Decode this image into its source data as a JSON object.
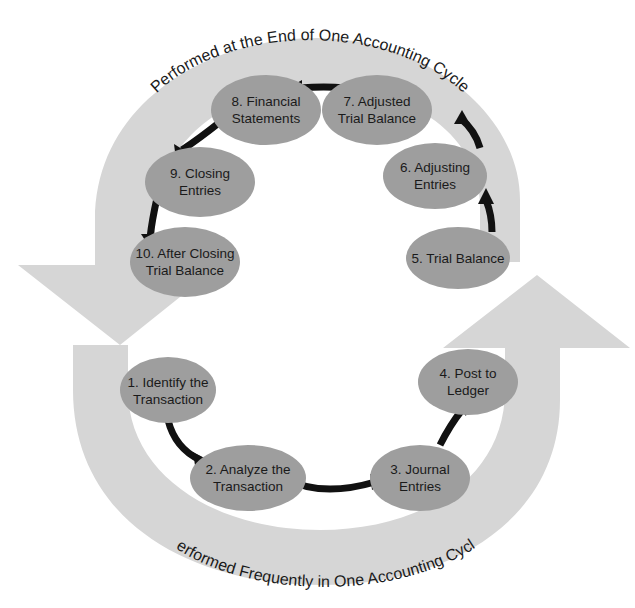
{
  "diagram": {
    "title_top": "Performed at the End of One Accounting Cycle",
    "title_bottom": "Performed Frequently in One Accounting Cycle",
    "colors": {
      "band": "#d6d6d6",
      "node": "#9e9e9e",
      "arrow": "#111111"
    },
    "nodes": [
      {
        "id": 1,
        "line1": "1. Identify the",
        "line2": "Transaction"
      },
      {
        "id": 2,
        "line1": "2. Analyze the",
        "line2": "Transaction"
      },
      {
        "id": 3,
        "line1": "3. Journal",
        "line2": "Entries"
      },
      {
        "id": 4,
        "line1": "4. Post to",
        "line2": "Ledger"
      },
      {
        "id": 5,
        "line1": "5. Trial Balance",
        "line2": ""
      },
      {
        "id": 6,
        "line1": "6. Adjusting",
        "line2": "Entries"
      },
      {
        "id": 7,
        "line1": "7. Adjusted",
        "line2": "Trial Balance"
      },
      {
        "id": 8,
        "line1": "8. Financial",
        "line2": "Statements"
      },
      {
        "id": 9,
        "line1": "9. Closing",
        "line2": "Entries"
      },
      {
        "id": 10,
        "line1": "10. After Closing",
        "line2": "Trial Balance"
      }
    ]
  }
}
